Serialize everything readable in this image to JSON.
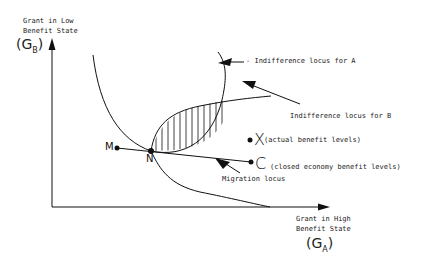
{
  "y_axis": {
    "label_line1": "Grant in Low",
    "label_line2": "Benefit State",
    "symbol": "(G",
    "subscript": "B",
    "close": ")"
  },
  "x_axis": {
    "label_line1": "Grant in High",
    "label_line2": "Benefit State",
    "symbol": "(G",
    "subscript": "A",
    "close": ")"
  },
  "annotations": {
    "locus_a": "Indifference locus for A",
    "locus_b": "Indifference locus for B",
    "actual": "(actual benefit levels)",
    "closed": "(closed economy benefit levels)",
    "migration": "Migration locus"
  },
  "points": {
    "M": "M",
    "N": "N",
    "X": "X",
    "C": "C"
  }
}
